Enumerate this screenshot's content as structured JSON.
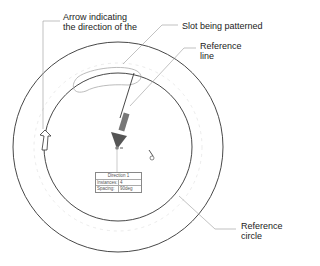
{
  "callouts": {
    "arrow_direction": [
      "Arrow indicating",
      "the direction of the"
    ],
    "slot": "Slot being patterned",
    "reference_line": [
      "Reference",
      "line"
    ],
    "reference_circle": [
      "Reference",
      "circle"
    ]
  },
  "dialog": {
    "title": "Direction 1",
    "rows": [
      {
        "label": "Instances:",
        "value": "4"
      },
      {
        "label": "Spacing:",
        "value": "90deg"
      }
    ]
  },
  "colors": {
    "line": "#333333",
    "leader": "#999999",
    "arrow_fill": "#555555"
  }
}
